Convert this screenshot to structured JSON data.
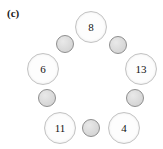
{
  "figure": {
    "panel_label": "(c)",
    "background_color": "#ffffff",
    "width": 163,
    "height": 149
  },
  "style": {
    "big_node_fill": "#fdfdfd",
    "big_node_border": "#c3c3c3",
    "big_node_text_color": "#111111",
    "small_node_fill": "#dcdcdc",
    "small_node_border": "#8f8f8f",
    "label_color": "#1a1a1a"
  },
  "diagram": {
    "type": "ring-graph",
    "big_nodes": [
      {
        "label": "8",
        "cx": 91,
        "cy": 27,
        "r": 16
      },
      {
        "label": "13",
        "cx": 141,
        "cy": 69,
        "r": 16
      },
      {
        "label": "4",
        "cx": 124,
        "cy": 128,
        "r": 16
      },
      {
        "label": "11",
        "cx": 60,
        "cy": 128,
        "r": 16
      },
      {
        "label": "6",
        "cx": 43,
        "cy": 69,
        "r": 16
      }
    ],
    "small_nodes": [
      {
        "label": "",
        "cx": 118,
        "cy": 45,
        "r": 9
      },
      {
        "label": "",
        "cx": 135,
        "cy": 98,
        "r": 9
      },
      {
        "label": "",
        "cx": 91,
        "cy": 128,
        "r": 9
      },
      {
        "label": "",
        "cx": 47,
        "cy": 98,
        "r": 9
      },
      {
        "label": "",
        "cx": 65,
        "cy": 44,
        "r": 9
      }
    ]
  }
}
